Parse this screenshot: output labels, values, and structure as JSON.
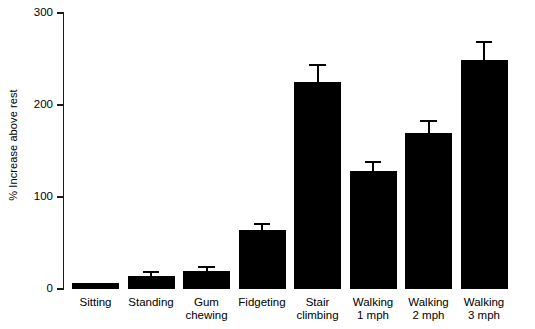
{
  "chart_data": {
    "type": "bar",
    "title": "",
    "xlabel": "",
    "ylabel": "% Increase above rest",
    "ylim": [
      0,
      300
    ],
    "yticks": [
      0,
      100,
      200,
      300
    ],
    "ytick_labels": [
      "0",
      "100",
      "200",
      "300"
    ],
    "grid": false,
    "legend": false,
    "bar_color": "#000000",
    "axis_color": "#1a1a1a",
    "categories": [
      "Sitting",
      "Standing",
      "Gum chewing",
      "Fidgeting",
      "Stair climbing",
      "Walking 1 mph",
      "Walking 2 mph",
      "Walking 3 mph"
    ],
    "category_lines": [
      [
        "Sitting",
        ""
      ],
      [
        "Standing",
        ""
      ],
      [
        "Gum",
        "chewing"
      ],
      [
        "Fidgeting",
        ""
      ],
      [
        "Stair",
        "climbing"
      ],
      [
        "Walking",
        "1 mph"
      ],
      [
        "Walking",
        "2 mph"
      ],
      [
        "Walking",
        "3 mph"
      ]
    ],
    "values": [
      7,
      14,
      20,
      64,
      225,
      128,
      170,
      249
    ],
    "errors": [
      0,
      3,
      3,
      6,
      17,
      9,
      12,
      18
    ],
    "series": [
      {
        "name": "% Increase above rest",
        "values": [
          7,
          14,
          20,
          64,
          225,
          128,
          170,
          249
        ],
        "errors": [
          0,
          3,
          3,
          6,
          17,
          9,
          12,
          18
        ]
      }
    ]
  }
}
